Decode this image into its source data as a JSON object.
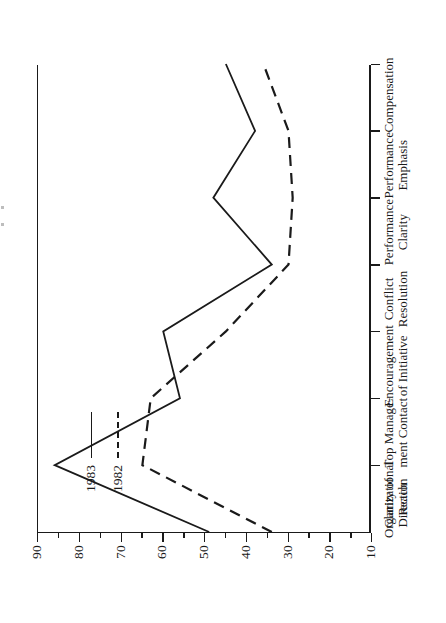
{
  "chart_data": {
    "type": "line",
    "title": "",
    "orientation": "rotated-90",
    "xlabel": "",
    "ylabel": "",
    "categories": [
      "Clarity of\nDirection",
      "Organizational\nReach",
      "Top Manage-\nment Contact",
      "Encouragement\nof Initiative",
      "Conflict\nResolution",
      "Performance\nClarity",
      "Performance\nEmphasis",
      "Compensation"
    ],
    "value_axis": {
      "ticks": [
        90,
        80,
        70,
        60,
        50,
        40,
        30,
        20,
        10
      ],
      "labels": [
        "90",
        "80",
        "70",
        "60",
        "50",
        "40",
        "30",
        "20",
        "10"
      ],
      "min": 10,
      "max": 90,
      "direction": "descending",
      "minor_ticks": true,
      "grid": false
    },
    "series": [
      {
        "name": "1983",
        "style": "solid",
        "color": "#1a1a1a",
        "values": [
          49,
          86,
          56,
          60,
          34,
          48,
          38,
          45
        ]
      },
      {
        "name": "1982",
        "style": "dashed",
        "color": "#1a1a1a",
        "values": [
          34,
          65,
          63,
          45,
          30,
          29,
          30,
          36
        ]
      }
    ],
    "legend": {
      "position": "upper-left",
      "entries": [
        {
          "label": "1983",
          "style": "solid"
        },
        {
          "label": "1982",
          "style": "dashed"
        }
      ]
    }
  }
}
